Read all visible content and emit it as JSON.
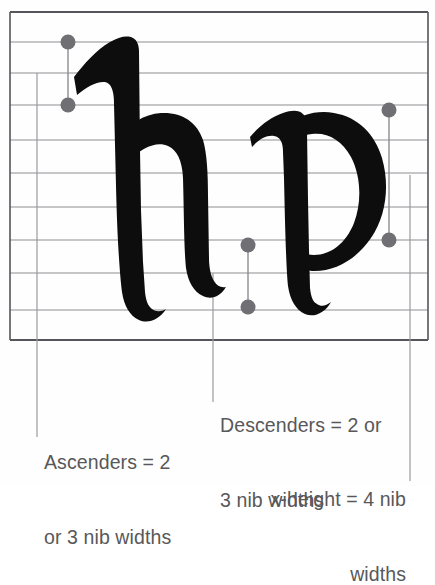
{
  "diagram": {
    "letters": [
      {
        "name": "letter-h",
        "glyph": "h",
        "role": "ascender-example"
      },
      {
        "name": "letter-p",
        "glyph": "p",
        "role": "descender-example"
      }
    ],
    "colors": {
      "ink": "#0d0d0d",
      "rule_line": "#8d8d92",
      "frame_line": "#55555a",
      "dot": "#6f6f74",
      "text": "#58585a",
      "background": "#ffffff"
    },
    "grid": {
      "frame": {
        "x": 10,
        "y": 12,
        "width": 418,
        "height": 328
      },
      "horizontal_rules_y": [
        42,
        73,
        105,
        140,
        173,
        207,
        240,
        273,
        310
      ],
      "vertical_guides_x": [
        37,
        213,
        410
      ]
    },
    "markers": [
      {
        "name": "ascender-top-dot",
        "x": 68,
        "y": 42
      },
      {
        "name": "ascender-bottom-dot",
        "x": 68,
        "y": 105
      },
      {
        "name": "xheight-top-dot",
        "x": 389,
        "y": 110
      },
      {
        "name": "xheight-bottom-dot",
        "x": 389,
        "y": 240
      },
      {
        "name": "descender-top-dot",
        "x": 248,
        "y": 245
      },
      {
        "name": "descender-bottom-dot",
        "x": 248,
        "y": 307
      }
    ]
  },
  "captions": {
    "ascenders": {
      "line1": "Ascenders = 2",
      "line2": "or 3 nib widths"
    },
    "descenders": {
      "line1": "Descenders = 2 or",
      "line2": "3 nib widths"
    },
    "xheight": {
      "line1": "x-height = 4 nib",
      "line2": "widths"
    }
  }
}
